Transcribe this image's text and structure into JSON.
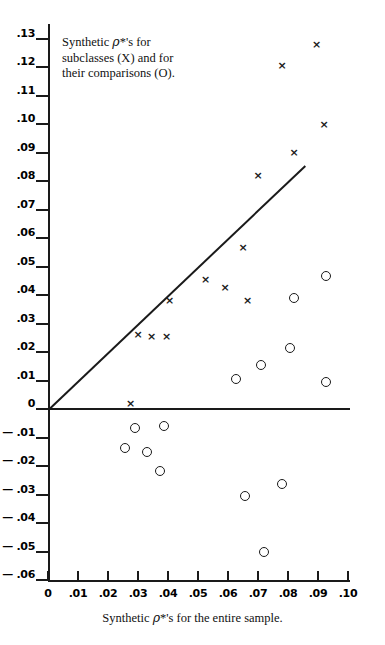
{
  "figure": {
    "caption": "Synthetic ρ*'s for the entire sample.",
    "caption_prefix": "Synthetic ",
    "caption_rho": "ρ",
    "caption_suffix": "*'s for the entire sample.",
    "legend_line1_prefix": "Synthetic ",
    "legend_line1_rho": "ρ",
    "legend_line1_suffix": "*'s for",
    "legend_line2": "subclasses (X) and for",
    "legend_line3": "their comparisons (O).",
    "marker_x_glyph": "×",
    "ink_color": "#1a1a1a"
  },
  "chart_data": {
    "type": "scatter",
    "title": "",
    "subtitle": "",
    "xlabel": "Synthetic ρ*'s for the entire sample.",
    "ylabel": "",
    "xlim": [
      0,
      0.105
    ],
    "ylim": [
      -0.065,
      0.135
    ],
    "grid": false,
    "legend_position": "top-left-inside",
    "legend_text": "Synthetic ρ*'s for subclasses (X) and for their comparisons (O).",
    "xticks": [
      0,
      0.01,
      0.02,
      0.03,
      0.04,
      0.05,
      0.06,
      0.07,
      0.08,
      0.09,
      0.1
    ],
    "xticklabels": [
      "0",
      ".01",
      ".02",
      ".03",
      ".04",
      ".05",
      ".06",
      ".07",
      ".08",
      ".09",
      ".10"
    ],
    "yticks": [
      0.13,
      0.12,
      0.11,
      0.1,
      0.09,
      0.08,
      0.07,
      0.06,
      0.05,
      0.04,
      0.03,
      0.02,
      0.01,
      0,
      -0.01,
      -0.02,
      -0.03,
      -0.04,
      -0.05,
      -0.06
    ],
    "yticklabels": [
      ".13",
      ".12",
      ".11",
      ".10",
      ".09",
      ".08",
      ".07",
      ".06",
      ".05",
      ".04",
      ".03",
      ".02",
      ".01",
      "0",
      "— .01",
      "— .02",
      "— .03",
      "— .04",
      "— .05",
      "— .06"
    ],
    "reference_line": {
      "label": "y = x identity line",
      "x0": 0.0,
      "y0": 0.0,
      "x1": 0.0855,
      "y1": 0.0855
    },
    "series": [
      {
        "name": "subclasses (X)",
        "marker": "x",
        "points": [
          {
            "x": 0.0895,
            "y": 0.128
          },
          {
            "x": 0.078,
            "y": 0.1205
          },
          {
            "x": 0.092,
            "y": 0.1
          },
          {
            "x": 0.082,
            "y": 0.09
          },
          {
            "x": 0.07,
            "y": 0.082
          },
          {
            "x": 0.065,
            "y": 0.0565
          },
          {
            "x": 0.0525,
            "y": 0.0455
          },
          {
            "x": 0.059,
            "y": 0.0425
          },
          {
            "x": 0.0665,
            "y": 0.038
          },
          {
            "x": 0.0405,
            "y": 0.038
          },
          {
            "x": 0.03,
            "y": 0.0262
          },
          {
            "x": 0.0345,
            "y": 0.0255
          },
          {
            "x": 0.0395,
            "y": 0.0255
          },
          {
            "x": 0.0275,
            "y": 0.002
          }
        ]
      },
      {
        "name": "comparisons (O)",
        "marker": "o",
        "points": [
          {
            "x": 0.0925,
            "y": 0.0465
          },
          {
            "x": 0.082,
            "y": 0.039
          },
          {
            "x": 0.0805,
            "y": 0.0215
          },
          {
            "x": 0.071,
            "y": 0.0155
          },
          {
            "x": 0.0925,
            "y": 0.0095
          },
          {
            "x": 0.0625,
            "y": 0.0105
          },
          {
            "x": 0.029,
            "y": -0.0068
          },
          {
            "x": 0.0385,
            "y": -0.0058
          },
          {
            "x": 0.0255,
            "y": -0.0138
          },
          {
            "x": 0.033,
            "y": -0.0152
          },
          {
            "x": 0.0372,
            "y": -0.0218
          },
          {
            "x": 0.078,
            "y": -0.0262
          },
          {
            "x": 0.0655,
            "y": -0.0305
          },
          {
            "x": 0.072,
            "y": -0.05
          }
        ]
      }
    ]
  }
}
